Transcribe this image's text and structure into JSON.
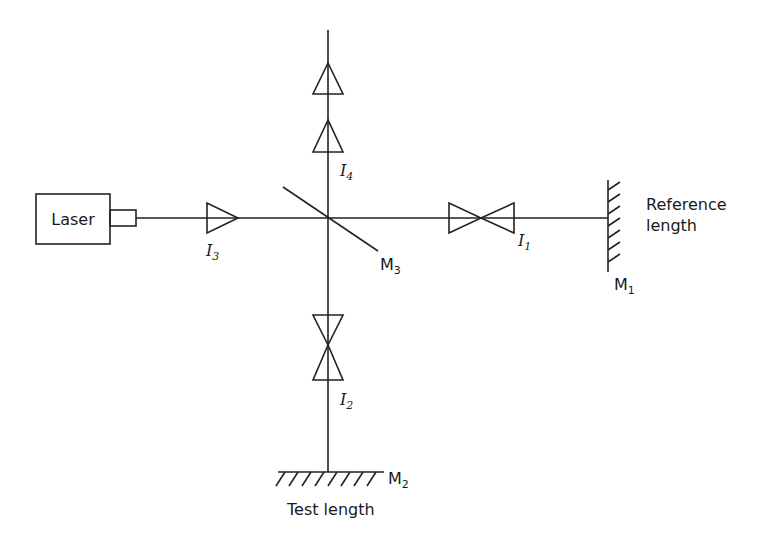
{
  "diagram": {
    "components": {
      "laser": {
        "label": "Laser"
      },
      "beam_splitter": {
        "label": "M",
        "sub": "3"
      },
      "reference_mirror": {
        "label": "M",
        "sub": "1",
        "caption_line1": "Reference",
        "caption_line2": "length"
      },
      "test_mirror": {
        "label": "M",
        "sub": "2",
        "caption": "Test length"
      }
    },
    "intensities": [
      {
        "label": "I",
        "sub": "1"
      },
      {
        "label": "I",
        "sub": "2"
      },
      {
        "label": "I",
        "sub": "3"
      },
      {
        "label": "I",
        "sub": "4"
      }
    ],
    "colors": {
      "line": "#222222",
      "background": "#ffffff"
    }
  }
}
